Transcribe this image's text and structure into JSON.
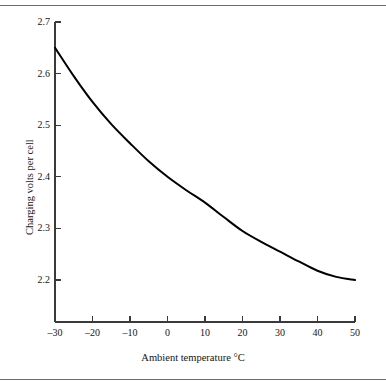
{
  "chart_data": {
    "type": "line",
    "title": "",
    "subtitle": "",
    "xlabel": "Ambient temperature °C",
    "ylabel": "Charging volts per cell",
    "xlim": [
      -30,
      50
    ],
    "ylim": [
      2.2,
      2.7
    ],
    "xticks": [
      -30,
      -20,
      -10,
      0,
      10,
      20,
      30,
      40,
      50
    ],
    "xtick_labels": [
      "–30",
      "–20",
      "–10",
      "0",
      "10",
      "20",
      "30",
      "40",
      "50"
    ],
    "yticks": [
      2.2,
      2.3,
      2.4,
      2.5,
      2.6,
      2.7
    ],
    "ytick_labels": [
      "2.2",
      "2.3",
      "2.4",
      "2.5",
      "2.6",
      "2.7"
    ],
    "grid": false,
    "legend": null,
    "legend_position": "none",
    "line_color": "#000000",
    "line_width": 2,
    "axis_color": "#3a3a3a",
    "series": [
      {
        "name": "Charging voltage vs ambient temperature",
        "x": [
          -30,
          -25,
          -20,
          -15,
          -10,
          -5,
          0,
          5,
          10,
          15,
          20,
          25,
          30,
          35,
          40,
          45,
          50
        ],
        "values": [
          2.65,
          2.595,
          2.545,
          2.502,
          2.465,
          2.43,
          2.4,
          2.374,
          2.35,
          2.322,
          2.295,
          2.274,
          2.255,
          2.236,
          2.218,
          2.206,
          2.2
        ]
      }
    ],
    "annotations": []
  },
  "figure": {
    "top_rule": "horizontal-rule",
    "bottom_rule": "horizontal-rule"
  }
}
